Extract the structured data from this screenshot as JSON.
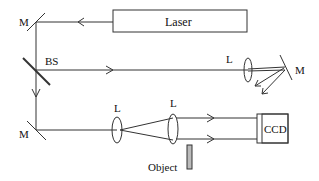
{
  "diagram": {
    "type": "optical-setup",
    "labels": {
      "laser": "Laser",
      "mirror_top": "M",
      "beam_splitter": "BS",
      "lens_reference": "L",
      "mirror_reference": "M",
      "mirror_bottom": "M",
      "lens_1": "L",
      "lens_2": "L",
      "detector": "CCD",
      "object": "Object"
    },
    "colors": {
      "line": "#333333",
      "object_fill": "#bbbbbb"
    }
  }
}
